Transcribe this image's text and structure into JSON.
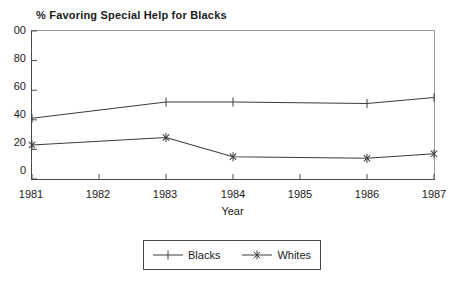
{
  "chart_data": {
    "type": "line",
    "title": "% Favoring Special Help for Blacks",
    "xlabel": "Year",
    "ylabel": "",
    "x": [
      1981,
      1982,
      1983,
      1984,
      1985,
      1986,
      1987
    ],
    "categories": [
      "1981",
      "1982",
      "1983",
      "1984",
      "1985",
      "1986",
      "1987"
    ],
    "xlim": [
      1981,
      1987
    ],
    "ylim": [
      0,
      100
    ],
    "yticks": [
      0,
      20,
      40,
      60,
      80,
      100
    ],
    "ytick_labels": [
      "0",
      "20",
      "40",
      "60",
      "80",
      "00"
    ],
    "xticks": [
      1981,
      1982,
      1983,
      1984,
      1985,
      1986,
      1987
    ],
    "xtick_labels": [
      "1981",
      "1982",
      "1983",
      "1984",
      "1985",
      "1986",
      "1987"
    ],
    "grid": false,
    "legend_position": "below-axis-centered",
    "series": [
      {
        "name": "Blacks",
        "marker": "plus",
        "color": "#3c3c3c",
        "x": [
          1981,
          1983,
          1984,
          1986,
          1987
        ],
        "values": [
          41,
          52,
          52,
          51,
          55
        ]
      },
      {
        "name": "Whites",
        "marker": "star",
        "color": "#3c3c3c",
        "x": [
          1981,
          1983,
          1984,
          1986,
          1987
        ],
        "values": [
          23,
          28,
          15,
          14,
          17
        ]
      }
    ]
  },
  "axis": {
    "ytick_0": "0",
    "ytick_20": "20",
    "ytick_40": "40",
    "ytick_60": "60",
    "ytick_80": "80",
    "ytick_100": "00",
    "xtick_1981": "1981",
    "xtick_1982": "1982",
    "xtick_1983": "1983",
    "xtick_1984": "1984",
    "xtick_1985": "1985",
    "xtick_1986": "1986",
    "xtick_1987": "1987",
    "xlabel": "Year"
  },
  "legend": {
    "entries": [
      {
        "label": "Blacks"
      },
      {
        "label": "Whites"
      }
    ]
  },
  "colors": {
    "line": "#3c3c3c",
    "axis": "#4a4a4a",
    "frame_light": "#9a9a9a",
    "background": "#ffffff",
    "text": "#1a1a1a"
  }
}
